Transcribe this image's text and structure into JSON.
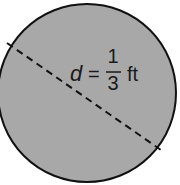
{
  "figure": {
    "shape": "circle",
    "fill_color": "#a8a8a8",
    "stroke_color": "#111111",
    "diameter_line": "dashed",
    "label": {
      "variable": "d",
      "equals": "=",
      "numerator": "1",
      "denominator": "3",
      "unit": "ft"
    }
  }
}
